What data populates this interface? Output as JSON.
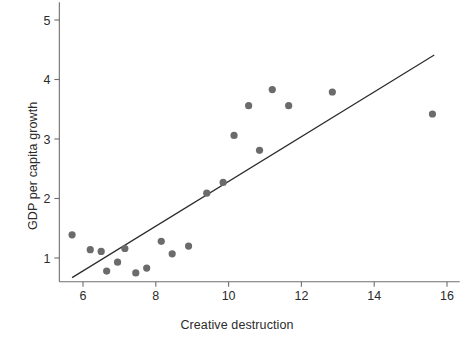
{
  "chart_data": {
    "type": "scatter",
    "title": "",
    "xlabel": "Creative destruction",
    "ylabel": "GDP per capita growth",
    "xlim": [
      5.35,
      16.35
    ],
    "ylim": [
      0.6,
      5.3
    ],
    "xticks": [
      6,
      8,
      10,
      12,
      14,
      16
    ],
    "xtick_labels": [
      "6",
      "8",
      "10",
      "12",
      "14",
      "16"
    ],
    "yticks": [
      1,
      2,
      3,
      4,
      5
    ],
    "ytick_labels": [
      "1",
      "2",
      "3",
      "4",
      "5"
    ],
    "grid": false,
    "legend": null,
    "marker_color": "#6b6b6b",
    "line_color": "#2b2b2b",
    "axis_color": "#6e6e6e",
    "points": [
      {
        "x": 5.7,
        "y": 1.39
      },
      {
        "x": 6.2,
        "y": 1.14
      },
      {
        "x": 6.5,
        "y": 1.11
      },
      {
        "x": 6.65,
        "y": 0.78
      },
      {
        "x": 6.95,
        "y": 0.93
      },
      {
        "x": 7.15,
        "y": 1.16
      },
      {
        "x": 7.45,
        "y": 0.75
      },
      {
        "x": 7.75,
        "y": 0.83
      },
      {
        "x": 8.15,
        "y": 1.28
      },
      {
        "x": 8.45,
        "y": 1.07
      },
      {
        "x": 8.9,
        "y": 1.2
      },
      {
        "x": 9.4,
        "y": 2.09
      },
      {
        "x": 9.85,
        "y": 2.27
      },
      {
        "x": 10.15,
        "y": 3.06
      },
      {
        "x": 10.55,
        "y": 3.56
      },
      {
        "x": 10.85,
        "y": 2.81
      },
      {
        "x": 11.2,
        "y": 3.83
      },
      {
        "x": 11.65,
        "y": 3.56
      },
      {
        "x": 12.85,
        "y": 3.79
      },
      {
        "x": 15.6,
        "y": 3.42
      }
    ],
    "fit_line": {
      "x_start": 5.7,
      "y_start": 0.67,
      "x_end": 15.65,
      "y_end": 4.41
    }
  }
}
